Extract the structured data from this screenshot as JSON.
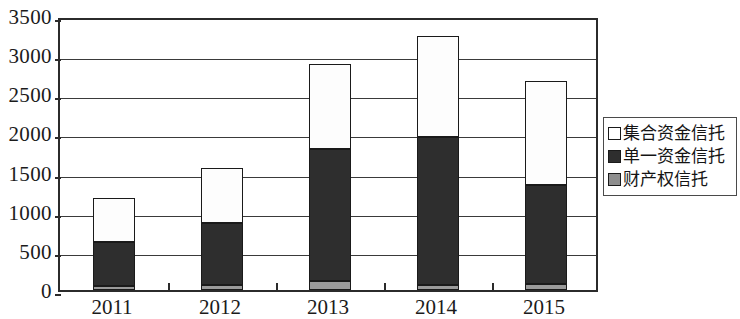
{
  "chart_data": {
    "type": "bar",
    "stacked": true,
    "title": "",
    "subtitle": "",
    "xlabel": "",
    "ylabel": "",
    "categories": [
      "2011",
      "2012",
      "2013",
      "2014",
      "2015"
    ],
    "ylim": [
      0,
      3500
    ],
    "yticks": [
      0,
      500,
      1000,
      1500,
      2000,
      2500,
      3000,
      3500
    ],
    "ytick_labels": [
      "0",
      "500",
      "1000",
      "1500",
      "2000",
      "2500",
      "3000",
      "3500"
    ],
    "grid": true,
    "legend_position": "right",
    "series": [
      {
        "name": "财产权信托",
        "color": "#8e8e8e",
        "stack_order": 0,
        "values": [
          55,
          60,
          115,
          70,
          75
        ]
      },
      {
        "name": "单一资金信托",
        "color": "#2e2e2e",
        "stack_order": 1,
        "values": [
          560,
          800,
          1680,
          1890,
          1270
        ]
      },
      {
        "name": "集合资金信托",
        "color": "#ffffff",
        "stack_order": 2,
        "values": [
          560,
          700,
          1090,
          1290,
          1320
        ]
      }
    ],
    "totals": [
      1175,
      1560,
      2885,
      3250,
      2665
    ]
  },
  "legend": {
    "items": [
      {
        "label": "集合资金信托",
        "swatch": "white"
      },
      {
        "label": "单一资金信托",
        "swatch": "black"
      },
      {
        "label": "财产权信托",
        "swatch": "gray"
      }
    ]
  }
}
